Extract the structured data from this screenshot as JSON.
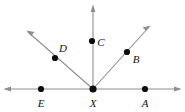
{
  "figure": {
    "background_color": "#ffffff",
    "line_color": "#8f8f8f",
    "dot_color": "#0d0d0d",
    "label_color": "#111111",
    "width": 185,
    "height": 112
  },
  "vertex": {
    "name": "X",
    "label": "X",
    "x": 93,
    "y": 89,
    "label_x": 93,
    "label_y": 103,
    "radius": 3.4
  },
  "points": [
    {
      "name": "A",
      "label": "A",
      "x": 145,
      "y": 89,
      "label_x": 145,
      "label_y": 103,
      "radius": 3.1
    },
    {
      "name": "B",
      "label": "B",
      "x": 127,
      "y": 52,
      "label_x": 136,
      "label_y": 59,
      "radius": 3.1
    },
    {
      "name": "C",
      "label": "C",
      "x": 92,
      "y": 41,
      "label_x": 101,
      "label_y": 42,
      "radius": 3.1
    },
    {
      "name": "D",
      "label": "D",
      "x": 55,
      "y": 58,
      "label_x": 63,
      "label_y": 48,
      "radius": 3.1
    },
    {
      "name": "E",
      "label": "E",
      "x": 41,
      "y": 89,
      "label_x": 41,
      "label_y": 103,
      "radius": 3.1
    }
  ],
  "rays": [
    {
      "name": "ray-XA-right",
      "x1": 93,
      "y1": 89,
      "x2": 180,
      "y2": 89,
      "arrow": true,
      "arrow_angle": 0
    },
    {
      "name": "ray-XE-left",
      "x1": 93,
      "y1": 89,
      "x2": 5,
      "y2": 89,
      "arrow": true,
      "arrow_angle": 180
    },
    {
      "name": "ray-XB-upper-right",
      "x1": 93,
      "y1": 89,
      "x2": 150,
      "y2": 26,
      "arrow": true,
      "arrow_angle": -47.9
    },
    {
      "name": "ray-XC-up",
      "x1": 93,
      "y1": 89,
      "x2": 93,
      "y2": 6,
      "arrow": true,
      "arrow_angle": -90
    },
    {
      "name": "ray-XD-upper-left",
      "x1": 93,
      "y1": 89,
      "x2": 27,
      "y2": 31,
      "arrow": true,
      "arrow_angle": -138.7
    }
  ],
  "arrow_style": {
    "length": 7.5,
    "half_width": 2.6
  }
}
